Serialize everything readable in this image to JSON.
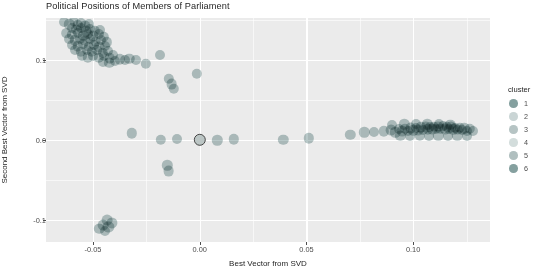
{
  "chart_data": {
    "type": "scatter",
    "title": "Political Positions of Members of Parliament",
    "xlabel": "Best Vector from SVD",
    "ylabel": "Second Best Vector from SVD",
    "xlim": [
      -0.072,
      0.136
    ],
    "ylim": [
      -0.128,
      0.152
    ],
    "xticks": [
      -0.05,
      0.0,
      0.05,
      0.1
    ],
    "xticklabels": [
      "-0.05",
      "0.00",
      "0.05",
      "0.10"
    ],
    "yticks": [
      0.1,
      0.0,
      -0.1
    ],
    "yticklabels": [
      "0.1",
      "0.0",
      "-0.1"
    ],
    "grid": true,
    "legend": {
      "title": "cluster",
      "position": "right",
      "entries": [
        {
          "label": "1",
          "color": "#6f8f8e",
          "opacity": 0.85
        },
        {
          "label": "2",
          "color": "#9fb3b2",
          "opacity": 0.55
        },
        {
          "label": "3",
          "color": "#8fa5a4",
          "opacity": 0.65
        },
        {
          "label": "4",
          "color": "#a8bbba",
          "opacity": 0.5
        },
        {
          "label": "5",
          "color": "#8aa1a0",
          "opacity": 0.68
        },
        {
          "label": "6",
          "color": "#708f8e",
          "opacity": 0.85
        }
      ]
    },
    "point_color": "#7d9a9a",
    "point_opacity": 0.55,
    "panel_background": "#ebebeb",
    "gridline_color": "#ffffff",
    "highlighted_point": {
      "x": 0.0,
      "y": 0.0,
      "outline": "#3d3d3d"
    },
    "points": [
      {
        "x": -0.0635,
        "y": 0.1465,
        "r": 5.0
      },
      {
        "x": -0.061,
        "y": 0.144,
        "r": 5.2
      },
      {
        "x": -0.059,
        "y": 0.148,
        "r": 4.8
      },
      {
        "x": -0.0572,
        "y": 0.143,
        "r": 5.2
      },
      {
        "x": -0.0556,
        "y": 0.1462,
        "r": 5.0
      },
      {
        "x": -0.0538,
        "y": 0.1418,
        "r": 5.4
      },
      {
        "x": -0.052,
        "y": 0.1448,
        "r": 5.0
      },
      {
        "x": -0.06,
        "y": 0.1395,
        "r": 5.0
      },
      {
        "x": -0.0578,
        "y": 0.1372,
        "r": 5.2
      },
      {
        "x": -0.0556,
        "y": 0.139,
        "r": 5.0
      },
      {
        "x": -0.0534,
        "y": 0.136,
        "r": 5.4
      },
      {
        "x": -0.0512,
        "y": 0.1382,
        "r": 5.0
      },
      {
        "x": -0.049,
        "y": 0.1352,
        "r": 5.2
      },
      {
        "x": -0.0468,
        "y": 0.1375,
        "r": 5.0
      },
      {
        "x": -0.0624,
        "y": 0.133,
        "r": 4.8
      },
      {
        "x": -0.0598,
        "y": 0.1312,
        "r": 5.2
      },
      {
        "x": -0.057,
        "y": 0.133,
        "r": 5.0
      },
      {
        "x": -0.0546,
        "y": 0.13,
        "r": 5.2
      },
      {
        "x": -0.0522,
        "y": 0.1322,
        "r": 5.0
      },
      {
        "x": -0.0498,
        "y": 0.1295,
        "r": 5.4
      },
      {
        "x": -0.0474,
        "y": 0.1315,
        "r": 5.0
      },
      {
        "x": -0.045,
        "y": 0.1288,
        "r": 5.2
      },
      {
        "x": -0.061,
        "y": 0.1258,
        "r": 5.0
      },
      {
        "x": -0.0585,
        "y": 0.124,
        "r": 5.2
      },
      {
        "x": -0.056,
        "y": 0.1262,
        "r": 5.0
      },
      {
        "x": -0.0536,
        "y": 0.1232,
        "r": 5.2
      },
      {
        "x": -0.0512,
        "y": 0.1252,
        "r": 5.0
      },
      {
        "x": -0.0488,
        "y": 0.1225,
        "r": 5.4
      },
      {
        "x": -0.0462,
        "y": 0.1245,
        "r": 5.0
      },
      {
        "x": -0.0436,
        "y": 0.1218,
        "r": 5.2
      },
      {
        "x": -0.0596,
        "y": 0.1185,
        "r": 5.0
      },
      {
        "x": -0.057,
        "y": 0.1168,
        "r": 5.2
      },
      {
        "x": -0.0545,
        "y": 0.119,
        "r": 5.0
      },
      {
        "x": -0.052,
        "y": 0.1162,
        "r": 5.2
      },
      {
        "x": -0.0495,
        "y": 0.1182,
        "r": 5.0
      },
      {
        "x": -0.047,
        "y": 0.1155,
        "r": 5.4
      },
      {
        "x": -0.0445,
        "y": 0.1175,
        "r": 5.0
      },
      {
        "x": -0.0582,
        "y": 0.1118,
        "r": 5.0
      },
      {
        "x": -0.0556,
        "y": 0.11,
        "r": 5.2
      },
      {
        "x": -0.053,
        "y": 0.1122,
        "r": 5.0
      },
      {
        "x": -0.0505,
        "y": 0.1095,
        "r": 5.2
      },
      {
        "x": -0.048,
        "y": 0.1115,
        "r": 5.0
      },
      {
        "x": -0.0455,
        "y": 0.1088,
        "r": 5.2
      },
      {
        "x": -0.043,
        "y": 0.1108,
        "r": 5.0
      },
      {
        "x": -0.055,
        "y": 0.1045,
        "r": 5.0
      },
      {
        "x": -0.0524,
        "y": 0.1028,
        "r": 5.2
      },
      {
        "x": -0.0498,
        "y": 0.1048,
        "r": 5.0
      },
      {
        "x": -0.0472,
        "y": 0.1022,
        "r": 5.2
      },
      {
        "x": -0.0446,
        "y": 0.1042,
        "r": 5.0
      },
      {
        "x": -0.042,
        "y": 0.1018,
        "r": 5.2
      },
      {
        "x": -0.0406,
        "y": 0.1055,
        "r": 5.0
      },
      {
        "x": -0.0452,
        "y": 0.0975,
        "r": 5.0
      },
      {
        "x": -0.0424,
        "y": 0.0958,
        "r": 5.2
      },
      {
        "x": -0.0398,
        "y": 0.0982,
        "r": 5.0
      },
      {
        "x": -0.0374,
        "y": 0.1002,
        "r": 5.2
      },
      {
        "x": -0.0352,
        "y": 0.0995,
        "r": 5.0
      },
      {
        "x": -0.033,
        "y": 0.1012,
        "r": 5.2
      },
      {
        "x": -0.03,
        "y": 0.0998,
        "r": 5.0
      },
      {
        "x": -0.0252,
        "y": 0.0945,
        "r": 5.2
      },
      {
        "x": -0.0188,
        "y": 0.1062,
        "r": 5.0
      },
      {
        "x": -0.0145,
        "y": 0.0762,
        "r": 5.2
      },
      {
        "x": -0.0132,
        "y": 0.0695,
        "r": 5.4
      },
      {
        "x": -0.0122,
        "y": 0.0638,
        "r": 5.2
      },
      {
        "x": -0.0014,
        "y": 0.0822,
        "r": 5.2
      },
      {
        "x": -0.0318,
        "y": 0.0078,
        "r": 5.2
      },
      {
        "x": -0.0182,
        "y": -0.0002,
        "r": 5.2
      },
      {
        "x": -0.0108,
        "y": 0.0005,
        "r": 5.0
      },
      {
        "x": 0.0,
        "y": 0.0,
        "r": 6.2,
        "selected": true
      },
      {
        "x": 0.0082,
        "y": -0.0008,
        "r": 5.2
      },
      {
        "x": 0.016,
        "y": 0.0002,
        "r": 5.2
      },
      {
        "x": 0.0392,
        "y": 0.0,
        "r": 5.2
      },
      {
        "x": 0.051,
        "y": 0.0018,
        "r": 5.2
      },
      {
        "x": -0.0152,
        "y": -0.0322,
        "r": 5.2
      },
      {
        "x": -0.0146,
        "y": -0.0395,
        "r": 5.4
      },
      {
        "x": -0.0432,
        "y": -0.1008,
        "r": 5.4
      },
      {
        "x": -0.041,
        "y": -0.1042,
        "r": 5.6
      },
      {
        "x": -0.0452,
        "y": -0.1068,
        "r": 5.4
      },
      {
        "x": -0.0428,
        "y": -0.1092,
        "r": 5.6
      },
      {
        "x": -0.047,
        "y": -0.1118,
        "r": 5.2
      },
      {
        "x": -0.0444,
        "y": -0.114,
        "r": 5.0
      },
      {
        "x": 0.0706,
        "y": 0.0062,
        "r": 5.2
      },
      {
        "x": 0.0772,
        "y": 0.0092,
        "r": 5.2
      },
      {
        "x": 0.0818,
        "y": 0.01,
        "r": 5.0
      },
      {
        "x": 0.0862,
        "y": 0.0105,
        "r": 5.2
      },
      {
        "x": 0.0898,
        "y": 0.0118,
        "r": 5.4
      },
      {
        "x": 0.0916,
        "y": 0.0092,
        "r": 5.2
      },
      {
        "x": 0.0934,
        "y": 0.0128,
        "r": 5.0
      },
      {
        "x": 0.0948,
        "y": 0.0102,
        "r": 5.4
      },
      {
        "x": 0.0962,
        "y": 0.0135,
        "r": 5.2
      },
      {
        "x": 0.0975,
        "y": 0.0108,
        "r": 5.0
      },
      {
        "x": 0.0988,
        "y": 0.0142,
        "r": 5.4
      },
      {
        "x": 0.1,
        "y": 0.0115,
        "r": 5.2
      },
      {
        "x": 0.1012,
        "y": 0.0148,
        "r": 5.0
      },
      {
        "x": 0.1024,
        "y": 0.012,
        "r": 5.4
      },
      {
        "x": 0.1036,
        "y": 0.0152,
        "r": 5.2
      },
      {
        "x": 0.1048,
        "y": 0.0125,
        "r": 5.0
      },
      {
        "x": 0.1058,
        "y": 0.0155,
        "r": 5.4
      },
      {
        "x": 0.1068,
        "y": 0.0128,
        "r": 5.2
      },
      {
        "x": 0.1078,
        "y": 0.0158,
        "r": 5.0
      },
      {
        "x": 0.1088,
        "y": 0.013,
        "r": 5.4
      },
      {
        "x": 0.1098,
        "y": 0.016,
        "r": 5.2
      },
      {
        "x": 0.1108,
        "y": 0.0132,
        "r": 5.0
      },
      {
        "x": 0.1118,
        "y": 0.0162,
        "r": 5.4
      },
      {
        "x": 0.1128,
        "y": 0.0134,
        "r": 5.2
      },
      {
        "x": 0.1138,
        "y": 0.0164,
        "r": 5.0
      },
      {
        "x": 0.1148,
        "y": 0.0136,
        "r": 5.4
      },
      {
        "x": 0.1158,
        "y": 0.016,
        "r": 5.2
      },
      {
        "x": 0.1168,
        "y": 0.0132,
        "r": 5.0
      },
      {
        "x": 0.1178,
        "y": 0.0155,
        "r": 5.4
      },
      {
        "x": 0.1188,
        "y": 0.0128,
        "r": 5.2
      },
      {
        "x": 0.1198,
        "y": 0.015,
        "r": 5.0
      },
      {
        "x": 0.1208,
        "y": 0.0124,
        "r": 5.4
      },
      {
        "x": 0.1218,
        "y": 0.0146,
        "r": 5.2
      },
      {
        "x": 0.1228,
        "y": 0.0118,
        "r": 5.0
      },
      {
        "x": 0.124,
        "y": 0.014,
        "r": 5.2
      },
      {
        "x": 0.1252,
        "y": 0.0112,
        "r": 5.0
      },
      {
        "x": 0.1266,
        "y": 0.0132,
        "r": 5.2
      },
      {
        "x": 0.128,
        "y": 0.0105,
        "r": 5.0
      },
      {
        "x": 0.094,
        "y": 0.0048,
        "r": 5.2
      },
      {
        "x": 0.0986,
        "y": 0.0042,
        "r": 5.0
      },
      {
        "x": 0.103,
        "y": 0.005,
        "r": 5.2
      },
      {
        "x": 0.1074,
        "y": 0.0045,
        "r": 5.0
      },
      {
        "x": 0.1118,
        "y": 0.0052,
        "r": 5.2
      },
      {
        "x": 0.1162,
        "y": 0.0046,
        "r": 5.0
      },
      {
        "x": 0.1206,
        "y": 0.0054,
        "r": 5.2
      },
      {
        "x": 0.125,
        "y": 0.0048,
        "r": 5.0
      },
      {
        "x": 0.0902,
        "y": 0.0188,
        "r": 5.0
      },
      {
        "x": 0.0958,
        "y": 0.0192,
        "r": 5.2
      },
      {
        "x": 0.1012,
        "y": 0.0196,
        "r": 5.0
      },
      {
        "x": 0.1066,
        "y": 0.019,
        "r": 5.2
      },
      {
        "x": 0.112,
        "y": 0.0194,
        "r": 5.0
      },
      {
        "x": 0.1174,
        "y": 0.0188,
        "r": 5.2
      }
    ]
  }
}
